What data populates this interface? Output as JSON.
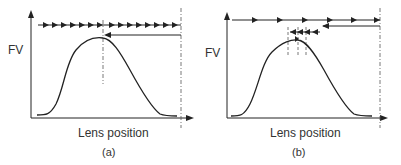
{
  "panels": [
    {
      "id": "a",
      "ylabel": "FV",
      "xlabel": "Lens position",
      "caption": "(a)",
      "description": "Fine forward scan with small steps across the entire range, then return to peak"
    },
    {
      "id": "b",
      "ylabel": "FV",
      "xlabel": "Lens position",
      "caption": "(b)",
      "description": "Coarse forward scan, return, then fine search steps near peak"
    }
  ],
  "colors": {
    "line": "#222222",
    "dashed": "#555555"
  }
}
